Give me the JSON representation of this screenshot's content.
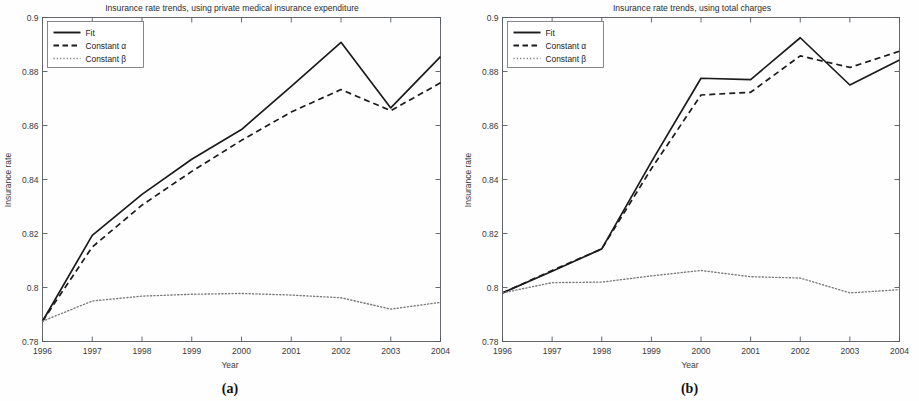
{
  "figure": {
    "caption_a": "(a)",
    "caption_b": "(b)"
  },
  "chart_data": [
    {
      "type": "line",
      "panel": "a",
      "title": "Insurance rate trends, using private medical insurance expenditure",
      "xlabel": "Year",
      "ylabel": "Insurance rate",
      "x": [
        1996,
        1997,
        1998,
        1999,
        2000,
        2001,
        2002,
        2003,
        2004
      ],
      "xticklabels": [
        "1996",
        "1997",
        "1998",
        "1999",
        "2000",
        "2001",
        "2002",
        "2003",
        "2004"
      ],
      "yticklabels": [
        "0.78",
        "0.8",
        "0.82",
        "0.84",
        "0.86",
        "0.88",
        "0.9"
      ],
      "ytickvalues": [
        0.78,
        0.8,
        0.82,
        0.84,
        0.86,
        0.88,
        0.9
      ],
      "xlim": [
        1996,
        2004
      ],
      "ylim": [
        0.78,
        0.9
      ],
      "grid": false,
      "legend_position": "top-left",
      "series": [
        {
          "name": "Fit",
          "style": "solid",
          "values": [
            0.7875,
            0.8193,
            0.8345,
            0.8475,
            0.8585,
            0.8745,
            0.8908,
            0.8665,
            0.8855
          ]
        },
        {
          "name": "Constant α",
          "style": "dashed",
          "values": [
            0.7875,
            0.815,
            0.8305,
            0.843,
            0.8545,
            0.865,
            0.8733,
            0.8655,
            0.8758
          ]
        },
        {
          "name": "Constant β",
          "style": "dotted",
          "values": [
            0.7875,
            0.795,
            0.7968,
            0.7975,
            0.7978,
            0.7972,
            0.7962,
            0.792,
            0.7945
          ]
        }
      ]
    },
    {
      "type": "line",
      "panel": "b",
      "title": "Insurance rate trends, using total charges",
      "xlabel": "Year",
      "ylabel": "Insurance rate",
      "x": [
        1996,
        1997,
        1998,
        1999,
        2000,
        2001,
        2002,
        2003,
        2004
      ],
      "xticklabels": [
        "1996",
        "1997",
        "1998",
        "1999",
        "2000",
        "2001",
        "2002",
        "2003",
        "2004"
      ],
      "yticklabels": [
        "0.78",
        "0.8",
        "0.82",
        "0.84",
        "0.86",
        "0.88",
        "0.9"
      ],
      "ytickvalues": [
        0.78,
        0.8,
        0.82,
        0.84,
        0.86,
        0.88,
        0.9
      ],
      "xlim": [
        1996,
        2004
      ],
      "ylim": [
        0.78,
        0.9
      ],
      "grid": false,
      "legend_position": "top-left",
      "series": [
        {
          "name": "Fit",
          "style": "solid",
          "values": [
            0.798,
            0.806,
            0.8143,
            0.8465,
            0.8775,
            0.877,
            0.8925,
            0.875,
            0.8843
          ]
        },
        {
          "name": "Constant α",
          "style": "dashed",
          "values": [
            0.798,
            0.8063,
            0.8143,
            0.844,
            0.8713,
            0.8723,
            0.8858,
            0.8815,
            0.8875
          ]
        },
        {
          "name": "Constant β",
          "style": "dotted",
          "values": [
            0.798,
            0.8018,
            0.802,
            0.8043,
            0.8063,
            0.804,
            0.8035,
            0.798,
            0.7992
          ]
        }
      ]
    }
  ]
}
